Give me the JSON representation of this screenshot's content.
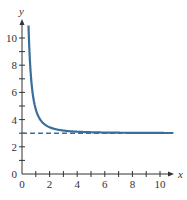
{
  "chart_data": {
    "type": "line",
    "title": "",
    "xlabel": "x",
    "ylabel": "y",
    "xlim": [
      0,
      11
    ],
    "ylim": [
      0,
      11
    ],
    "x_ticks": [
      0,
      2,
      4,
      6,
      8,
      10
    ],
    "y_ticks": [
      0,
      2,
      4,
      6,
      8,
      10
    ],
    "x_tick_labels": [
      "0",
      "2",
      "4",
      "6",
      "8",
      "10"
    ],
    "y_tick_labels": [
      "0",
      "2",
      "4",
      "6",
      "8",
      "10"
    ],
    "grid": false,
    "legend": null,
    "series": [
      {
        "name": "curve",
        "style": "solid",
        "color": "#3a6f9c",
        "x": [
          0.5,
          0.6,
          0.75,
          1,
          1.25,
          1.5,
          2,
          2.5,
          3,
          4,
          5,
          6,
          8,
          10,
          11
        ],
        "y": [
          10.8,
          8.3,
          6.2,
          4.6,
          3.9,
          3.55,
          3.25,
          3.14,
          3.09,
          3.05,
          3.03,
          3.02,
          3.01,
          3.0,
          3.0
        ]
      },
      {
        "name": "horizontal asymptote y = 3",
        "style": "dashed",
        "color": "#3a6f9c",
        "x": [
          0,
          11
        ],
        "y": [
          3,
          3
        ]
      }
    ]
  },
  "axes": {
    "x_label": "x",
    "y_label": "y",
    "origin_label": "0"
  }
}
